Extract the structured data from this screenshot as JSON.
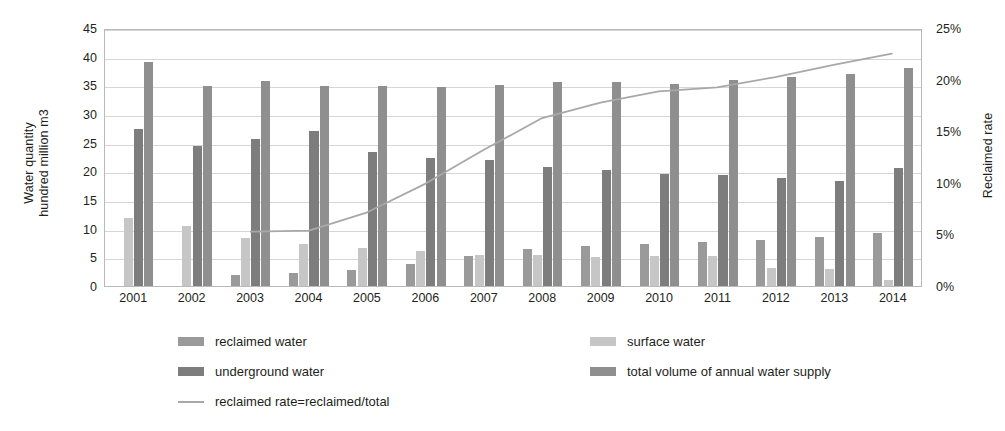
{
  "chart_data": {
    "type": "bar",
    "title": "",
    "subtitle": "",
    "categories": [
      "2001",
      "2002",
      "2003",
      "2004",
      "2005",
      "2006",
      "2007",
      "2008",
      "2009",
      "2010",
      "2011",
      "2012",
      "2013",
      "2014"
    ],
    "xlabel": "",
    "ylabel": "Water quantity hundred million m3",
    "ylabel_line1": "Water quantity",
    "ylabel_line2": "hundred million m3",
    "ylim": [
      0,
      45
    ],
    "yticks": [
      0,
      5,
      10,
      15,
      20,
      25,
      30,
      35,
      40,
      45
    ],
    "ytick_labels": [
      "0",
      "5",
      "10",
      "15",
      "20",
      "25",
      "30",
      "35",
      "40",
      "45"
    ],
    "y2label": "Reclaimed rate",
    "y2lim": [
      0,
      25
    ],
    "y2ticks": [
      0,
      5,
      10,
      15,
      20,
      25
    ],
    "y2tick_labels": [
      "0%",
      "5%",
      "10%",
      "15%",
      "20%",
      "25%"
    ],
    "grid": true,
    "legend_position": "bottom",
    "series": [
      {
        "name": "reclaimed water",
        "key": "reclaimed",
        "type": "bar",
        "color": "#9a9a9a",
        "axis": "left",
        "values": [
          0,
          0,
          2.0,
          2.3,
          2.8,
          3.9,
          5.3,
          6.4,
          6.9,
          7.3,
          7.6,
          8.0,
          8.6,
          9.3
        ]
      },
      {
        "name": "surface water",
        "key": "surface",
        "type": "bar",
        "color": "#c6c6c6",
        "axis": "left",
        "values": [
          11.8,
          10.4,
          8.4,
          7.4,
          6.6,
          6.1,
          5.4,
          5.4,
          5.1,
          5.3,
          5.2,
          3.1,
          3.0,
          1.0
        ]
      },
      {
        "name": "underground water",
        "key": "underground",
        "type": "bar",
        "color": "#7d7d7d",
        "axis": "left",
        "values": [
          27.3,
          24.4,
          25.6,
          27.0,
          23.4,
          22.4,
          21.9,
          20.8,
          20.2,
          19.6,
          19.3,
          18.9,
          18.4,
          20.5
        ]
      },
      {
        "name": "total volume of annual water supply",
        "key": "total",
        "type": "bar",
        "color": "#8f8f8f",
        "axis": "left",
        "values": [
          39.0,
          34.8,
          35.8,
          34.8,
          34.8,
          34.7,
          35.1,
          35.5,
          35.5,
          35.2,
          36.0,
          36.4,
          36.9,
          38.1
        ]
      },
      {
        "name": "reclaimed rate=reclaimed/total",
        "key": "reclaimed_rate",
        "type": "line",
        "color": "#a8a8a8",
        "axis": "right",
        "unit": "%",
        "values": [
          null,
          null,
          5.3,
          5.4,
          7.2,
          10.0,
          13.3,
          16.4,
          17.9,
          19.0,
          19.4,
          20.4,
          21.6,
          22.7
        ]
      }
    ]
  },
  "legend": {
    "entries": [
      {
        "label": "reclaimed water",
        "marker": "swatch",
        "color": "#9a9a9a"
      },
      {
        "label": "underground water",
        "marker": "swatch",
        "color": "#7d7d7d"
      },
      {
        "label": "reclaimed rate=reclaimed/total",
        "marker": "line",
        "color": "#a8a8a8"
      },
      {
        "label": "surface water",
        "marker": "swatch",
        "color": "#c6c6c6"
      },
      {
        "label": "total volume of annual water supply",
        "marker": "swatch",
        "color": "#8f8f8f"
      }
    ]
  }
}
